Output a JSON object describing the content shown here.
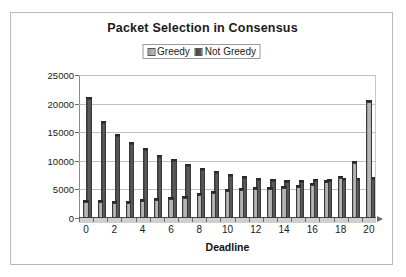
{
  "chart_data": {
    "type": "bar",
    "title": "Packet Selection in Consensus",
    "xlabel": "Deadline",
    "ylabel": "",
    "ylim": [
      0,
      25000
    ],
    "ytick_values": [
      0,
      5000,
      10000,
      15000,
      20000,
      25000
    ],
    "ytick_labels": [
      "0",
      "5000",
      "10000",
      "15000",
      "20000",
      "25000"
    ],
    "grid": true,
    "legend_position": "top-center",
    "categories": [
      0,
      1,
      2,
      3,
      4,
      5,
      6,
      7,
      8,
      9,
      10,
      11,
      12,
      13,
      14,
      15,
      16,
      17,
      18,
      19,
      20
    ],
    "xtick_labels": [
      "0",
      "2",
      "4",
      "6",
      "8",
      "10",
      "12",
      "14",
      "16",
      "18",
      "20"
    ],
    "series": [
      {
        "name": "Greedy",
        "color": "#b0b0b0",
        "values": [
          2800,
          2800,
          2600,
          2600,
          2900,
          3100,
          3300,
          3500,
          4000,
          4300,
          4700,
          4900,
          5000,
          5100,
          5200,
          5400,
          5800,
          6300,
          7000,
          9700,
          20300
        ]
      },
      {
        "name": "Not Greedy",
        "color": "#4f4f4f",
        "values": [
          20300,
          16000,
          13900,
          12500,
          11300,
          10200,
          9400,
          8600,
          7900,
          7300,
          6800,
          6400,
          6100,
          5900,
          5800,
          5800,
          5900,
          6000,
          6100,
          6200,
          6300
        ]
      }
    ]
  },
  "legend": {
    "items": [
      {
        "label": "Greedy",
        "color": "#b0b0b0"
      },
      {
        "label": "Not Greedy",
        "color": "#4f4f4f"
      }
    ]
  }
}
